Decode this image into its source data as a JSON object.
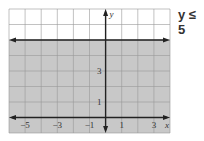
{
  "inequality_label": "y ≤ 5",
  "chart_data": {
    "type": "inequality-graph",
    "title": "y ≤ 5",
    "xlabel": "x",
    "ylabel": "y",
    "xlim": [
      -6,
      4
    ],
    "ylim": [
      -1,
      7
    ],
    "x_tick_labels": [
      "−5",
      "−3",
      "−1",
      "1",
      "3"
    ],
    "x_ticks": [
      -5,
      -3,
      -1,
      1,
      3
    ],
    "y_tick_labels": [
      "1",
      "3"
    ],
    "y_ticks": [
      1,
      3
    ],
    "grid": true,
    "boundary_line": {
      "equation": "y = 5",
      "style": "solid"
    },
    "shaded_region": "below",
    "shade_color": "#c8c8c8"
  }
}
